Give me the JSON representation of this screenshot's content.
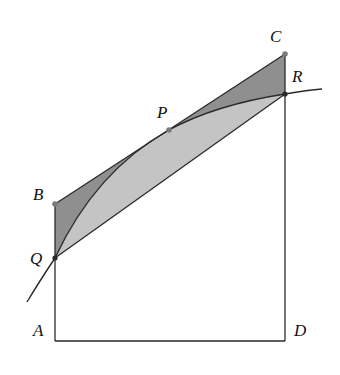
{
  "figure": {
    "type": "geometry-diagram",
    "colors": {
      "stroke": "#2a2a2a",
      "dark_shade": "#8f8f8f",
      "light_shade": "#c4c4c4",
      "point": "#7a7a7a",
      "background": "#ffffff"
    },
    "points": {
      "A": {
        "label": "A",
        "x": 55,
        "y": 341
      },
      "B": {
        "label": "B",
        "x": 55,
        "y": 204
      },
      "C": {
        "label": "C",
        "x": 285,
        "y": 54
      },
      "D": {
        "label": "D",
        "x": 285,
        "y": 341
      },
      "P": {
        "label": "P",
        "x": 169,
        "y": 130
      },
      "Q": {
        "label": "Q",
        "x": 55,
        "y": 258
      },
      "R": {
        "label": "R",
        "x": 285,
        "y": 94
      }
    },
    "labels": {
      "A": "A",
      "B": "B",
      "C": "C",
      "D": "D",
      "P": "P",
      "Q": "Q",
      "R": "R"
    }
  }
}
